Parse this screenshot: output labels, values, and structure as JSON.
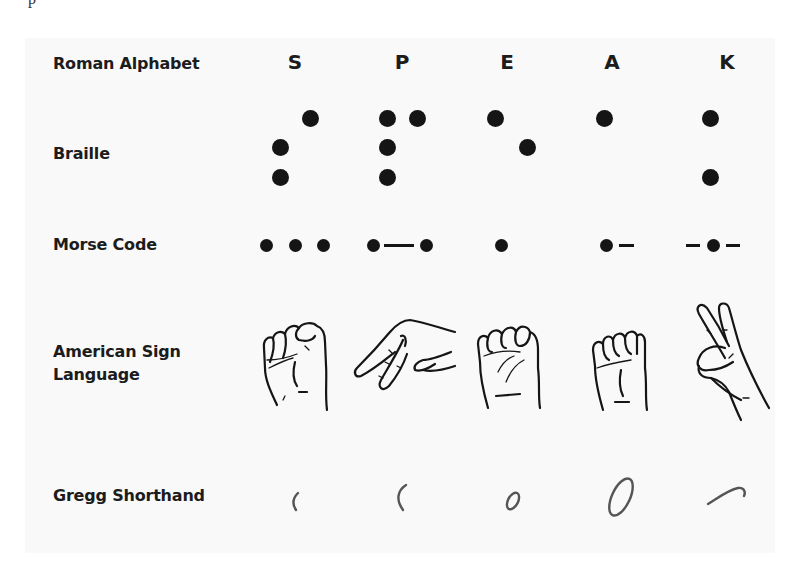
{
  "crop_fragment": "p",
  "colors": {
    "ink": "#151515",
    "panel_bg": "#f9f9f9",
    "gregg_ink": "#555555"
  },
  "rows": {
    "roman": {
      "label": "Roman Alphabet",
      "letters": [
        "S",
        "P",
        "E",
        "A",
        "K"
      ]
    },
    "braille": {
      "label": "Braille",
      "cells": [
        {
          "letter": "S",
          "dots": [
            2,
            3,
            4
          ]
        },
        {
          "letter": "P",
          "dots": [
            1,
            2,
            3,
            4
          ]
        },
        {
          "letter": "E",
          "dots": [
            1,
            5
          ]
        },
        {
          "letter": "A",
          "dots": [
            1
          ]
        },
        {
          "letter": "K",
          "dots": [
            1,
            3
          ]
        }
      ]
    },
    "morse": {
      "label": "Morse Code",
      "codes": [
        {
          "letter": "S",
          "code": "..."
        },
        {
          "letter": "P",
          "code": ".--."
        },
        {
          "letter": "E",
          "code": "."
        },
        {
          "letter": "A",
          "code": ".-"
        },
        {
          "letter": "K",
          "code": "-.-"
        }
      ]
    },
    "asl": {
      "label_line1": "American Sign",
      "label_line2": "Language",
      "signs": [
        "hand-sign-s-icon",
        "hand-sign-p-icon",
        "hand-sign-e-icon",
        "hand-sign-a-icon",
        "hand-sign-k-icon"
      ]
    },
    "gregg": {
      "label": "Gregg Shorthand",
      "strokes": [
        "gregg-s-stroke-icon",
        "gregg-p-stroke-icon",
        "gregg-e-stroke-icon",
        "gregg-a-stroke-icon",
        "gregg-k-stroke-icon"
      ]
    }
  }
}
